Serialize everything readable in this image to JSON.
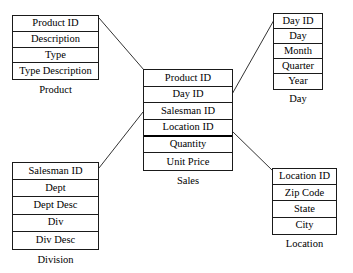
{
  "diagram": {
    "type": "star-schema",
    "title": "",
    "line_color": "#333333",
    "border_color": "#1a1a1a",
    "background": "#ffffff"
  },
  "entities": {
    "product": {
      "caption": "Product",
      "fields": [
        "Product ID",
        "Description",
        "Type",
        "Type Description"
      ]
    },
    "division": {
      "caption": "Division",
      "fields": [
        "Salesman ID",
        "Dept",
        "Dept Desc",
        "Div",
        "Div Desc"
      ]
    },
    "sales": {
      "caption": "Sales",
      "fields": [
        "Product ID",
        "Day ID",
        "Salesman ID",
        "Location ID",
        "Quantity",
        "Unit Price"
      ]
    },
    "day": {
      "caption": "Day",
      "fields": [
        "Day ID",
        "Day",
        "Month",
        "Quarter",
        "Year"
      ]
    },
    "location": {
      "caption": "Location",
      "fields": [
        "Location ID",
        "Zip Code",
        "State",
        "City"
      ]
    }
  },
  "relationships": [
    {
      "name": "product-to-sales",
      "from": "product",
      "to": "sales"
    },
    {
      "name": "day-to-sales",
      "from": "sales",
      "to": "day"
    },
    {
      "name": "division-to-sales",
      "from": "division",
      "to": "sales"
    },
    {
      "name": "location-to-sales",
      "from": "sales",
      "to": "location"
    }
  ]
}
